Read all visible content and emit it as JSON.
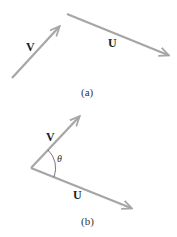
{
  "colors": {
    "vector": "#a6a6a6",
    "text": "#222222",
    "arc": "#555555"
  },
  "panel_a": {
    "caption": "(a)",
    "vector_v": {
      "label": "V",
      "from": [
        12,
        78
      ],
      "to": [
        59,
        27
      ]
    },
    "vector_u": {
      "label": "U",
      "from": [
        67,
        14
      ],
      "to": [
        168,
        55
      ]
    }
  },
  "panel_b": {
    "caption": "(b)",
    "origin": [
      31,
      168
    ],
    "vector_v": {
      "label": "V",
      "to": [
        79,
        117
      ]
    },
    "vector_u": {
      "label": "U",
      "to": [
        131,
        208
      ]
    },
    "angle_label": "θ"
  }
}
